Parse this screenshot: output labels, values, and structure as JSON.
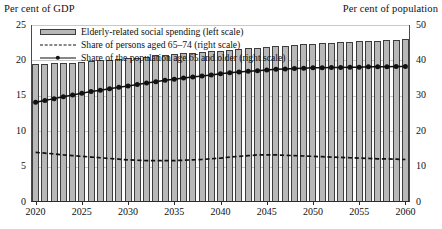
{
  "axes": {
    "left_title": "Per cent of GDP",
    "right_title": "Per cent of population",
    "left_ticks": [
      "0",
      "5",
      "10",
      "15",
      "20",
      "25"
    ],
    "right_ticks": [
      "0",
      "10",
      "20",
      "30",
      "40",
      "50"
    ],
    "x_ticks": [
      "2020",
      "2025",
      "2030",
      "2035",
      "2040",
      "2045",
      "2050",
      "2055",
      "2060"
    ]
  },
  "legend": {
    "items": [
      {
        "label": "Elderly-related social spending (left scale)",
        "key": "bar-swatch"
      },
      {
        "label": "Share of persons aged 65–74 (right scale)",
        "key": "dashed-line-swatch"
      },
      {
        "label": "Share of the population age 65 and older (right scale)",
        "key": "marker-line-swatch"
      }
    ]
  },
  "colors": {
    "bar_fill": "#b8b8b8",
    "bar_stroke": "#3d3d3d",
    "line": "#111111",
    "grid": "#c9c9c9",
    "axis": "#2b2b2b",
    "text": "#111111"
  },
  "chart_data": {
    "type": "bar",
    "title": "",
    "xlabel": "",
    "ylabel": "Per cent of GDP",
    "y2label": "Per cent of population",
    "ylim": [
      0,
      25
    ],
    "y2lim": [
      0,
      50
    ],
    "xlim": [
      2020,
      2060
    ],
    "grid": true,
    "legend_position": "top-left",
    "x": [
      2020,
      2021,
      2022,
      2023,
      2024,
      2025,
      2026,
      2027,
      2028,
      2029,
      2030,
      2031,
      2032,
      2033,
      2034,
      2035,
      2036,
      2037,
      2038,
      2039,
      2040,
      2041,
      2042,
      2043,
      2044,
      2045,
      2046,
      2047,
      2048,
      2049,
      2050,
      2051,
      2052,
      2053,
      2054,
      2055,
      2056,
      2057,
      2058,
      2059,
      2060
    ],
    "categories": [
      "2020",
      "2021",
      "2022",
      "2023",
      "2024",
      "2025",
      "2026",
      "2027",
      "2028",
      "2029",
      "2030",
      "2031",
      "2032",
      "2033",
      "2034",
      "2035",
      "2036",
      "2037",
      "2038",
      "2039",
      "2040",
      "2041",
      "2042",
      "2043",
      "2044",
      "2045",
      "2046",
      "2047",
      "2048",
      "2049",
      "2050",
      "2051",
      "2052",
      "2053",
      "2054",
      "2055",
      "2056",
      "2057",
      "2058",
      "2059",
      "2060"
    ],
    "series": [
      {
        "name": "Elderly-related social spending (left scale)",
        "type": "bar",
        "axis": "left",
        "values": [
          19.5,
          19.5,
          19.6,
          19.6,
          19.7,
          19.8,
          19.9,
          20.0,
          20.1,
          20.2,
          20.3,
          20.4,
          20.5,
          20.7,
          20.8,
          20.9,
          21.0,
          21.1,
          21.2,
          21.3,
          21.4,
          21.5,
          21.6,
          21.7,
          21.8,
          21.9,
          22.0,
          22.1,
          22.2,
          22.3,
          22.3,
          22.4,
          22.5,
          22.6,
          22.6,
          22.7,
          22.8,
          22.8,
          22.9,
          22.9,
          23.0
        ]
      },
      {
        "name": "Share of persons aged 65–74 (right scale)",
        "type": "line",
        "style": "dashed",
        "axis": "right",
        "values": [
          14.0,
          13.8,
          13.6,
          13.3,
          13.1,
          12.9,
          12.7,
          12.5,
          12.3,
          12.1,
          11.9,
          11.8,
          11.7,
          11.7,
          11.7,
          11.7,
          11.8,
          11.9,
          12.0,
          12.2,
          12.4,
          12.7,
          12.9,
          13.1,
          13.3,
          13.3,
          13.3,
          13.2,
          13.1,
          13.0,
          12.9,
          12.8,
          12.7,
          12.6,
          12.5,
          12.4,
          12.3,
          12.2,
          12.2,
          12.1,
          12.0
        ]
      },
      {
        "name": "Share of the population age 65 and older (right scale)",
        "type": "line",
        "style": "solid-markers",
        "axis": "right",
        "values": [
          28.2,
          28.7,
          29.2,
          29.7,
          30.2,
          30.7,
          31.2,
          31.6,
          32.0,
          32.4,
          32.8,
          33.2,
          33.6,
          34.0,
          34.4,
          34.7,
          35.0,
          35.3,
          35.6,
          35.9,
          36.2,
          36.5,
          36.7,
          36.9,
          37.1,
          37.3,
          37.5,
          37.6,
          37.7,
          37.8,
          37.9,
          37.9,
          38.0,
          38.0,
          38.1,
          38.1,
          38.2,
          38.2,
          38.2,
          38.3,
          38.3
        ]
      }
    ]
  }
}
